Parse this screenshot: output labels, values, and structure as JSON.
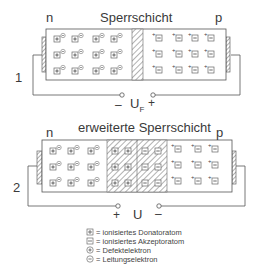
{
  "diagram1": {
    "number": "1",
    "title": "Sperrschicht",
    "left_region": "n",
    "right_region": "p",
    "voltage_label": "U",
    "voltage_subscript": "F",
    "left_terminal_sign": "–",
    "right_terminal_sign": "+"
  },
  "diagram2": {
    "number": "2",
    "title": "erweiterte Sperrschicht",
    "left_region": "n",
    "right_region": "p",
    "voltage_label": "U",
    "left_terminal_sign": "+",
    "right_terminal_sign": "–"
  },
  "legend": {
    "items": [
      {
        "symbol": "boxed-plus",
        "text": "= ionisiertes Donatoratom"
      },
      {
        "symbol": "boxed-minus",
        "text": "= ionisiertes Akzeptoratom"
      },
      {
        "symbol": "circled-plus",
        "text": "= Defektelektron"
      },
      {
        "symbol": "circled-minus",
        "text": "= Leitungselektron"
      }
    ]
  },
  "colors": {
    "line": "#555555",
    "hatch": "#777777",
    "text": "#3a3a3a"
  }
}
